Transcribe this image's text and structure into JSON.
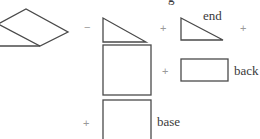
{
  "diagram": {
    "title_fragment": "g",
    "stroke_color": "#4a4a4a",
    "operator_color": "#9a9a9a",
    "label_color": "#3a3a3a",
    "operators": [
      "−",
      "+",
      "+",
      "+",
      "+"
    ],
    "shapes": [
      {
        "name": "parallelogram",
        "label": ""
      },
      {
        "name": "triangle-left",
        "label": ""
      },
      {
        "name": "triangle-end",
        "label": "end"
      },
      {
        "name": "square-middle",
        "label": ""
      },
      {
        "name": "rectangle-back",
        "label": "back"
      },
      {
        "name": "square-base",
        "label": "base"
      }
    ]
  }
}
